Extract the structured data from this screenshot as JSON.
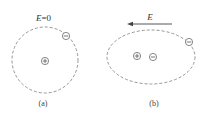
{
  "panels": [
    {
      "id": "a",
      "caption": "(a)",
      "field_label_symbol": "E",
      "field_label_value": "=0",
      "orbit_shape": "circle",
      "charges": [
        {
          "role": "nucleus",
          "sign": "+"
        },
        {
          "role": "electron",
          "sign": "−"
        }
      ]
    },
    {
      "id": "b",
      "caption": "(b)",
      "field_label_symbol": "E",
      "field_direction": "left",
      "orbit_shape": "ellipse",
      "charges": [
        {
          "role": "nucleus",
          "sign": "+"
        },
        {
          "role": "electron-cloud-center",
          "sign": "−"
        },
        {
          "role": "electron",
          "sign": "−"
        }
      ]
    }
  ],
  "colors": {
    "orbit": "#8a8a8a",
    "text": "#333333"
  }
}
